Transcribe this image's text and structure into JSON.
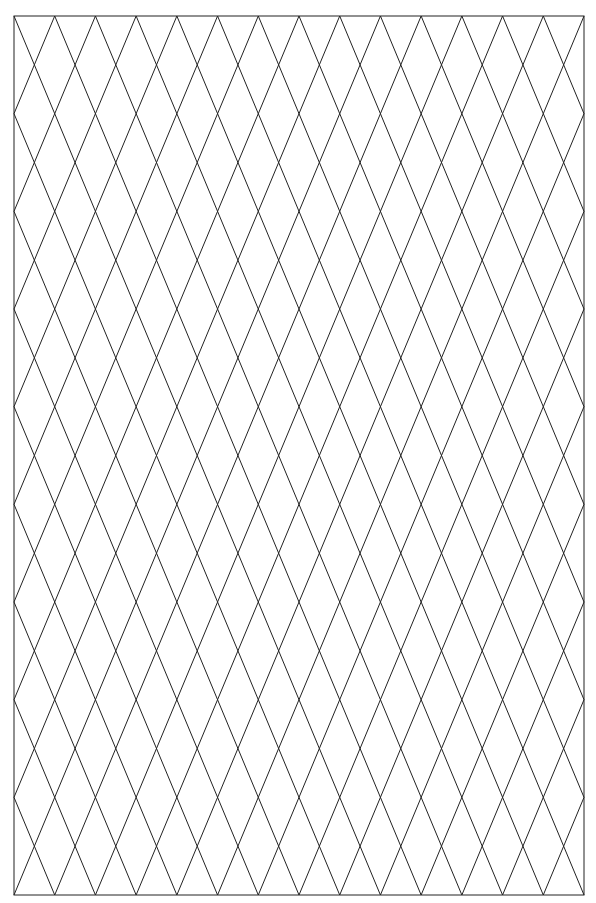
{
  "figure": {
    "type": "diamond-lattice-grid",
    "canvas": {
      "width": 596,
      "height": 903,
      "background": "#ffffff"
    },
    "frame": {
      "x": 14,
      "y": 16,
      "width": 570,
      "height": 879
    },
    "columns": 14,
    "rows": 9,
    "line_color": "#222222",
    "line_width": 1
  }
}
